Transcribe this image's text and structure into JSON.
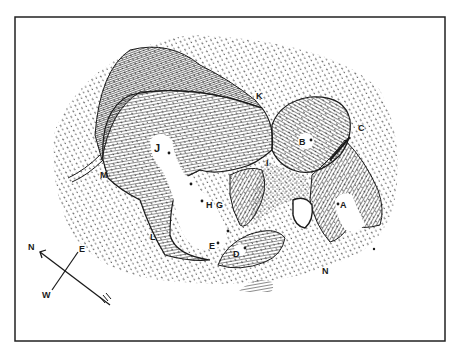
{
  "figure": {
    "type": "hachure-map",
    "colors": {
      "ink": "#1a1a1a",
      "paper": "#ffffff",
      "frame": "#222222"
    }
  },
  "labels": {
    "A": "A",
    "B": "B",
    "C": "C",
    "D": "D",
    "E": "E",
    "G": "G",
    "H": "H",
    "I": "I",
    "J": "J",
    "K": "K",
    "L": "L",
    "M": "M",
    "N": "N"
  },
  "compass": {
    "north": "N",
    "east": "E",
    "west": "W",
    "icon": "compass-rose-icon"
  }
}
